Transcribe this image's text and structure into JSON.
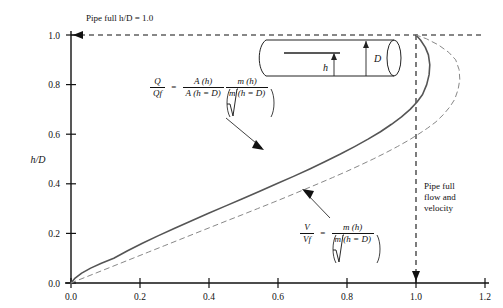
{
  "figure": {
    "top_note": "Pipe full h/D = 1.0",
    "right_note_line1": "Pipe full",
    "right_note_line2": "flow and",
    "right_note_line3": "velocity",
    "inset": {
      "h_label": "h",
      "d_label": "D"
    },
    "formula_q": {
      "lhs_num": "Q",
      "lhs_den": "Qf",
      "eq": "=",
      "t1_num": "A (h)",
      "t1_den": "A (h = D)",
      "t2_num": "m (h)",
      "t2_den": "m (h = D)"
    },
    "formula_v": {
      "lhs_num": "V",
      "lhs_den": "Vf",
      "eq": "=",
      "t2_num": "m (h)",
      "t2_den": "m (h = D)"
    },
    "colors": {
      "solid": "#555555",
      "dashed": "#888888",
      "axis": "#111111"
    }
  },
  "chart_data": {
    "type": "line",
    "title": "",
    "xlabel": "",
    "ylabel": "h/D",
    "xlim": [
      0.0,
      1.2
    ],
    "ylim": [
      0.0,
      1.0
    ],
    "xticks": [
      "0.0",
      "0.2",
      "0.4",
      "0.6",
      "0.8",
      "1.0",
      "1.2"
    ],
    "xtick_values": [
      0.0,
      0.2,
      0.4,
      0.6,
      0.8,
      1.0,
      1.2
    ],
    "yticks": [
      "0.0",
      "0.2",
      "0.4",
      "0.6",
      "0.8",
      "1.0"
    ],
    "ytick_values": [
      0.0,
      0.2,
      0.4,
      0.6,
      0.8,
      1.0
    ],
    "grid": false,
    "legend": "none",
    "series": [
      {
        "name": "Q/Qf",
        "style": "solid",
        "x": [
          0.0,
          0.012,
          0.031,
          0.057,
          0.088,
          0.124,
          0.164,
          0.207,
          0.252,
          0.299,
          0.348,
          0.397,
          0.447,
          0.497,
          0.547,
          0.596,
          0.645,
          0.692,
          0.737,
          0.781,
          0.822,
          0.861,
          0.897,
          0.929,
          0.958,
          0.983,
          1.003,
          1.019,
          1.031,
          1.038,
          1.04,
          1.036,
          1.027,
          1.013,
          1.0
        ],
        "y": [
          0.0,
          0.02,
          0.04,
          0.06,
          0.08,
          0.1,
          0.13,
          0.16,
          0.19,
          0.22,
          0.25,
          0.28,
          0.31,
          0.34,
          0.37,
          0.4,
          0.43,
          0.46,
          0.49,
          0.52,
          0.55,
          0.58,
          0.61,
          0.64,
          0.67,
          0.7,
          0.73,
          0.76,
          0.8,
          0.84,
          0.88,
          0.92,
          0.95,
          0.98,
          1.0
        ]
      },
      {
        "name": "V/Vf",
        "style": "dashed",
        "x": [
          0.0,
          0.045,
          0.09,
          0.135,
          0.18,
          0.225,
          0.27,
          0.315,
          0.36,
          0.405,
          0.45,
          0.496,
          0.541,
          0.586,
          0.63,
          0.673,
          0.716,
          0.758,
          0.799,
          0.838,
          0.876,
          0.912,
          0.946,
          0.978,
          1.007,
          1.034,
          1.058,
          1.08,
          1.098,
          1.112,
          1.122,
          1.127,
          1.125,
          1.115,
          1.095,
          1.065,
          1.03,
          1.0
        ],
        "y": [
          0.0,
          0.025,
          0.05,
          0.075,
          0.1,
          0.125,
          0.15,
          0.175,
          0.2,
          0.225,
          0.25,
          0.275,
          0.3,
          0.325,
          0.35,
          0.375,
          0.4,
          0.425,
          0.45,
          0.475,
          0.5,
          0.525,
          0.55,
          0.575,
          0.6,
          0.625,
          0.65,
          0.68,
          0.71,
          0.74,
          0.78,
          0.82,
          0.86,
          0.9,
          0.93,
          0.96,
          0.985,
          1.0
        ]
      }
    ],
    "reference_lines": [
      {
        "name": "pipe-full-horizontal",
        "orientation": "horizontal",
        "value": 1.0,
        "style": "dashed"
      },
      {
        "name": "pipe-full-vertical",
        "orientation": "vertical",
        "value": 1.0,
        "style": "dashed"
      }
    ]
  }
}
